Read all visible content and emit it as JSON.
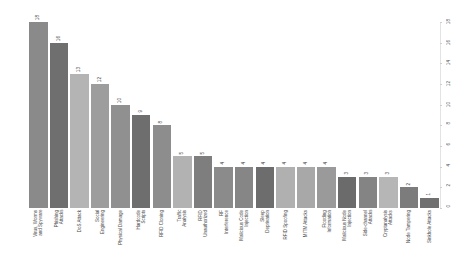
{
  "chart_data": {
    "type": "bar",
    "title": "",
    "subtitle": "",
    "xlabel": "",
    "ylabel": "",
    "ylim": [
      0,
      18
    ],
    "grid": false,
    "legend": null,
    "axis_position": "right",
    "yticks": [
      0,
      2,
      4,
      6,
      8,
      10,
      12,
      14,
      16,
      18
    ],
    "ytick_labels": [
      "0",
      "2",
      "4",
      "6",
      "8",
      "10",
      "12",
      "14",
      "16",
      "18"
    ],
    "categories": [
      "Virus, Worms\nand Spyware",
      "Phishing\nAttacks",
      "DoS Attack",
      "Social\nEngineering",
      "Physical Damage",
      "Hardcode\nScripts",
      "RFID Cloning",
      "Traffic\nAnalysis",
      "RFID\nUnauthorized",
      "RF\nInterference",
      "Malicious Code\nInjection",
      "Sleep\nDeprivation",
      "RFID Spoofing",
      "MITM Attacks",
      "Flooding\nInformation",
      "Malicious Node\nInjection",
      "Side-channel\nAttacks",
      "Cryptanalysis\nAttacks",
      "Node Tampering",
      "Sinkhole Attacks"
    ],
    "values": [
      18,
      16,
      13,
      12,
      10,
      9,
      8,
      5,
      5,
      4,
      4,
      4,
      4,
      4,
      4,
      3,
      3,
      3,
      2,
      1
    ],
    "bar_colors": [
      "#8a8a8a",
      "#6f6f6f",
      "#b4b4b4",
      "#9d9d9d",
      "#909090",
      "#6e6e6e",
      "#8d8d8d",
      "#b2b2b2",
      "#7e7e7e",
      "#8b8b8b",
      "#868686",
      "#6d6d6d",
      "#b0b0b0",
      "#a8a8a8",
      "#9a9a9a",
      "#6b6b6b",
      "#848484",
      "#b6b6b6",
      "#7c7c7c",
      "#707070"
    ]
  }
}
